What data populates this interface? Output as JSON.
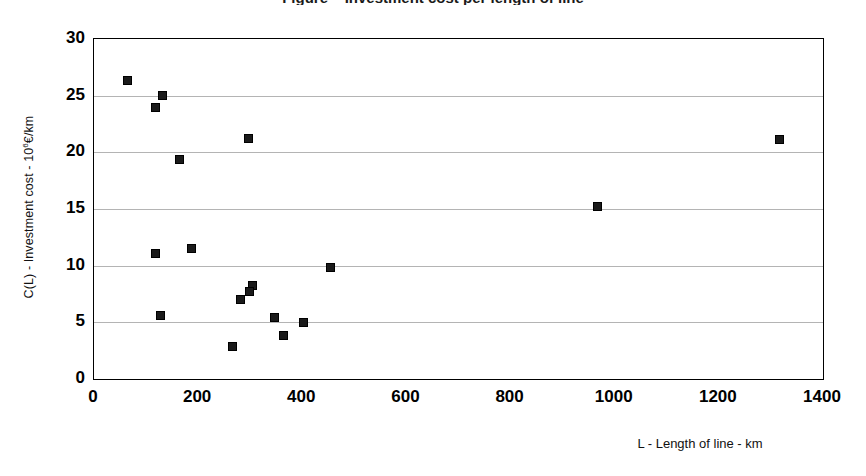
{
  "title": {
    "text": "Figure – Investment cost per length of line"
  },
  "axes": {
    "ylabel_main": "C(L) - Investment cost - 10",
    "ylabel_exponent": "6",
    "ylabel_tail": "€/km",
    "xlabel": "L - Length of line - km"
  },
  "chart_data": {
    "type": "scatter",
    "title": "",
    "xlabel": "L - Length of line - km",
    "ylabel": "C(L) - Investment cost - 10^6 €/km",
    "xlim": [
      0,
      1400
    ],
    "ylim": [
      0,
      30
    ],
    "xticks": [
      0,
      200,
      400,
      600,
      800,
      1000,
      1200,
      1400
    ],
    "yticks": [
      0,
      5,
      10,
      15,
      20,
      25,
      30
    ],
    "xtick_labels": [
      "0",
      "200",
      "400",
      "600",
      "800",
      "1000",
      "1200",
      "1400"
    ],
    "ytick_labels": [
      "0",
      "5",
      "10",
      "15",
      "20",
      "25",
      "30"
    ],
    "grid": "horizontal",
    "legend": "none",
    "marker": "filled-square",
    "marker_color": "#1a1a1a",
    "series": [
      {
        "name": "Investment cost",
        "points": [
          {
            "x": 65,
            "y": 26.3
          },
          {
            "x": 120,
            "y": 23.9
          },
          {
            "x": 133,
            "y": 25.0
          },
          {
            "x": 165,
            "y": 19.3
          },
          {
            "x": 297,
            "y": 21.2
          },
          {
            "x": 1318,
            "y": 21.1
          },
          {
            "x": 968,
            "y": 15.2
          },
          {
            "x": 120,
            "y": 11.0
          },
          {
            "x": 188,
            "y": 11.5
          },
          {
            "x": 455,
            "y": 9.8
          },
          {
            "x": 306,
            "y": 8.2
          },
          {
            "x": 299,
            "y": 7.7
          },
          {
            "x": 283,
            "y": 7.0
          },
          {
            "x": 128,
            "y": 5.6
          },
          {
            "x": 348,
            "y": 5.4
          },
          {
            "x": 404,
            "y": 4.9
          },
          {
            "x": 364,
            "y": 3.8
          },
          {
            "x": 266,
            "y": 2.8
          }
        ]
      }
    ]
  }
}
